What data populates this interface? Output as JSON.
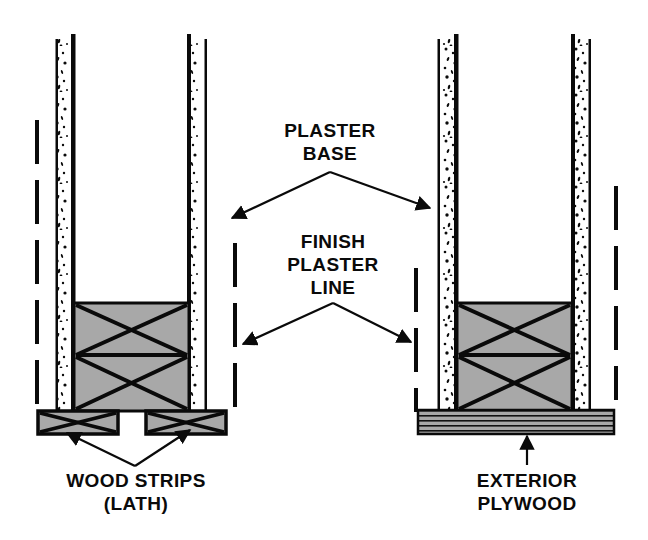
{
  "figure": {
    "kind": "construction-detail-diagram",
    "background_color": "#ffffff",
    "ink_color": "#0a0a0a",
    "fill_gray": "#a8a8a8"
  },
  "labels": {
    "plaster_base": {
      "lines": [
        "PLASTER",
        "BASE"
      ],
      "line1": "PLASTER",
      "line2": "BASE"
    },
    "finish_plaster_line": {
      "lines": [
        "FINISH",
        "PLASTER",
        "LINE"
      ],
      "line1": "FINISH",
      "line2": "PLASTER",
      "line3": "LINE"
    },
    "wood_strips": {
      "lines": [
        "WOOD STRIPS",
        "(LATH)"
      ],
      "line1": "WOOD STRIPS",
      "line2": "(LATH)"
    },
    "exterior_plywood": {
      "lines": [
        "EXTERIOR",
        "PLYWOOD"
      ],
      "line1": "EXTERIOR",
      "line2": "PLYWOOD"
    }
  },
  "assemblies": {
    "left": {
      "name": "wood-strips-assembly",
      "description": "Two wood lath strips under the blocking, gap between them"
    },
    "right": {
      "name": "exterior-plywood-assembly",
      "description": "Continuous exterior plywood sheet under the blocking"
    }
  },
  "annotations": {
    "plaster_base_targets": [
      "left-inner-wall-panel",
      "right-outer-wall-panel"
    ],
    "finish_plaster_line_targets": [
      "left-dashed-finish-line",
      "right-dashed-finish-line"
    ],
    "wood_strips_targets": [
      "left-wood-strip",
      "right-wood-strip"
    ],
    "exterior_plywood_targets": [
      "plywood-sheet"
    ]
  }
}
